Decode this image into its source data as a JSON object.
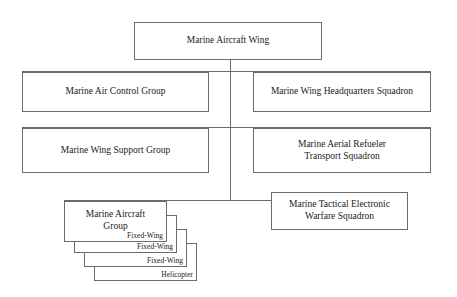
{
  "diagram": {
    "title_node": {
      "label": "Marine Aircraft Wing"
    },
    "nodes": [
      {
        "id": "mac-group",
        "label": "Marine Air Control Group"
      },
      {
        "id": "mwhs",
        "label": "Marine Wing Headquarters Squadron"
      },
      {
        "id": "mws-group",
        "label": "Marine Wing Support Group"
      },
      {
        "id": "marts",
        "label": "Marine Aerial Refueler\nTransport Squadron"
      },
      {
        "id": "mtews",
        "label": "Marine Tactical Electronic\nWarfare Squadron"
      }
    ],
    "aircraft_group": {
      "label": "Marine Aircraft\nGroup",
      "front_sublabel": "Fixed-Wing",
      "stacked_layers": [
        {
          "label": "Fixed-Wing"
        },
        {
          "label": "Fixed-Wing"
        },
        {
          "label": "Helicopter"
        }
      ]
    },
    "colors": {
      "background": "#ffffff",
      "box_border": "#6b6b6b",
      "connector": "#6b6b6b",
      "text": "#1a1a1a"
    }
  }
}
